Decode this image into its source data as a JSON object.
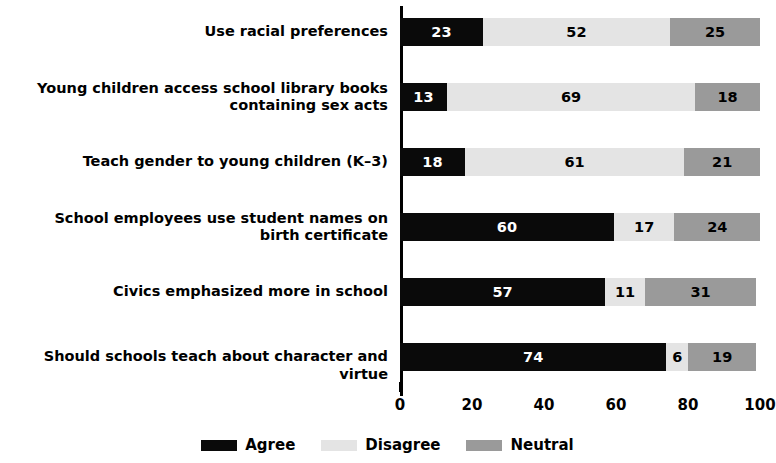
{
  "chart_data": {
    "type": "bar",
    "orientation": "horizontal",
    "stacked": true,
    "title": "",
    "subtitle": "",
    "xlabel": "",
    "ylabel": "",
    "xlim": [
      0,
      100
    ],
    "xticks": [
      "0",
      "20",
      "40",
      "60",
      "80",
      "100"
    ],
    "xtick_values": [
      0,
      20,
      40,
      60,
      80,
      100
    ],
    "grid": false,
    "legend_position": "bottom-center",
    "categories": [
      "Use racial preferences",
      "Young children access school library books containing sex acts",
      "Teach gender to young children (K–3)",
      "School employees use student names on birth certificate",
      "Civics emphasized more in school",
      "Should schools teach about character and virtue"
    ],
    "series": [
      {
        "name": "Agree",
        "color": "#0a0a0a",
        "values": [
          23,
          13,
          18,
          60,
          57,
          74
        ]
      },
      {
        "name": "Disagree",
        "color": "#e4e4e4",
        "values": [
          52,
          69,
          61,
          17,
          11,
          6
        ]
      },
      {
        "name": "Neutral",
        "color": "#9a9a9a",
        "values": [
          25,
          18,
          21,
          24,
          31,
          19
        ]
      }
    ]
  },
  "legend": {
    "items": [
      {
        "label": "Agree",
        "color": "#0a0a0a"
      },
      {
        "label": "Disagree",
        "color": "#e4e4e4"
      },
      {
        "label": "Neutral",
        "color": "#9a9a9a"
      }
    ]
  },
  "category_labels": [
    {
      "lines": [
        "Use racial preferences"
      ]
    },
    {
      "lines": [
        "Young children access school library books",
        "containing sex acts"
      ]
    },
    {
      "lines": [
        "Teach gender to young children (K–3)"
      ]
    },
    {
      "lines": [
        "School employees use student names on",
        "birth certificate"
      ]
    },
    {
      "lines": [
        "Civics emphasized more in school"
      ]
    },
    {
      "lines": [
        "Should schools teach about character and virtue"
      ]
    }
  ],
  "axis": {
    "x_tick_labels": [
      "0",
      "20",
      "40",
      "60",
      "80",
      "100"
    ]
  }
}
